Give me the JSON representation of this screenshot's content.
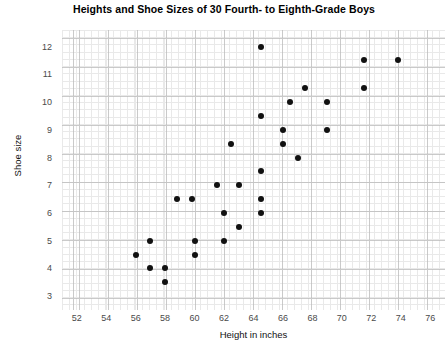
{
  "chart_data": {
    "type": "scatter",
    "title": "Heights and Shoe Sizes of 30 Fourth- to Eighth-Grade Boys",
    "xlabel": "Height in inches",
    "ylabel": "Shoe size",
    "xlim": [
      51,
      77
    ],
    "ylim": [
      2.5,
      12.6
    ],
    "xticks": [
      52,
      54,
      56,
      58,
      60,
      62,
      64,
      66,
      68,
      70,
      72,
      74,
      76
    ],
    "yticks": [
      3,
      4,
      5,
      6,
      7,
      8,
      9,
      10,
      11,
      12
    ],
    "grid": true,
    "legend": null,
    "n_points": 30,
    "marker": {
      "shape": "circle",
      "color": "#111111",
      "size": 6
    },
    "points": [
      {
        "x": 64.5,
        "y": 12.0
      },
      {
        "x": 71.5,
        "y": 11.5
      },
      {
        "x": 73.8,
        "y": 11.5
      },
      {
        "x": 71.5,
        "y": 10.5
      },
      {
        "x": 67.5,
        "y": 10.5
      },
      {
        "x": 69.0,
        "y": 10.0
      },
      {
        "x": 66.5,
        "y": 10.0
      },
      {
        "x": 64.5,
        "y": 9.5
      },
      {
        "x": 66.0,
        "y": 9.0
      },
      {
        "x": 69.0,
        "y": 9.0
      },
      {
        "x": 62.5,
        "y": 8.5
      },
      {
        "x": 66.0,
        "y": 8.5
      },
      {
        "x": 67.0,
        "y": 8.0
      },
      {
        "x": 64.5,
        "y": 7.5
      },
      {
        "x": 61.5,
        "y": 7.0
      },
      {
        "x": 63.0,
        "y": 7.0
      },
      {
        "x": 64.5,
        "y": 6.5
      },
      {
        "x": 58.8,
        "y": 6.5
      },
      {
        "x": 59.8,
        "y": 6.5
      },
      {
        "x": 62.0,
        "y": 6.0
      },
      {
        "x": 64.5,
        "y": 6.0
      },
      {
        "x": 63.0,
        "y": 5.5
      },
      {
        "x": 62.0,
        "y": 5.0
      },
      {
        "x": 60.0,
        "y": 5.0
      },
      {
        "x": 57.0,
        "y": 5.0
      },
      {
        "x": 56.0,
        "y": 4.5
      },
      {
        "x": 60.0,
        "y": 4.5
      },
      {
        "x": 57.0,
        "y": 4.0
      },
      {
        "x": 58.0,
        "y": 4.0
      },
      {
        "x": 58.0,
        "y": 3.5
      }
    ]
  }
}
